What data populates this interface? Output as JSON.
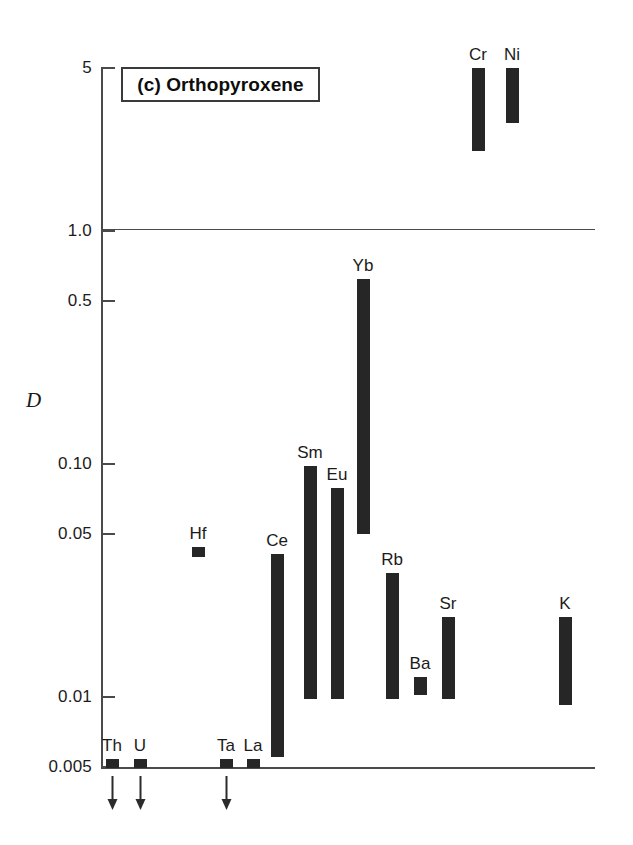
{
  "figure": {
    "panel_label": "(c) Orthopyroxene",
    "y_axis_title": "D"
  },
  "chart_data": {
    "type": "bar",
    "title": "(c) Orthopyroxene",
    "xlabel": "",
    "ylabel": "D",
    "yscale": "log",
    "ylim": [
      0.005,
      5
    ],
    "grid": "single horizontal line at D = 1.0",
    "legend": "none",
    "ytick_labels": [
      "5",
      "1.0",
      "0.5",
      "0.10",
      "0.05",
      "0.01",
      "0.005"
    ],
    "ytick_values": [
      5,
      1.0,
      0.5,
      0.1,
      0.05,
      0.01,
      0.005
    ],
    "categories": [
      "Th",
      "U",
      "Ta",
      "La",
      "Hf",
      "Ce",
      "Sm",
      "Eu",
      "Yb",
      "Rb",
      "Ba",
      "Sr",
      "K",
      "Cr",
      "Ni"
    ],
    "ranges": [
      {
        "name": "Th",
        "low": 0.005,
        "high": 0.0054,
        "upper_limit": true,
        "x": 112
      },
      {
        "name": "U",
        "low": 0.005,
        "high": 0.0054,
        "upper_limit": true,
        "x": 140
      },
      {
        "name": "Ta",
        "low": 0.005,
        "high": 0.0054,
        "upper_limit": true,
        "x": 226
      },
      {
        "name": "La",
        "low": 0.005,
        "high": 0.0054,
        "upper_limit": false,
        "x": 253
      },
      {
        "name": "Hf",
        "low": 0.04,
        "high": 0.044,
        "upper_limit": false,
        "x": 198
      },
      {
        "name": "Ce",
        "low": 0.0055,
        "high": 0.041,
        "upper_limit": false,
        "x": 277
      },
      {
        "name": "Sm",
        "low": 0.0098,
        "high": 0.098,
        "upper_limit": false,
        "x": 310
      },
      {
        "name": "Eu",
        "low": 0.0098,
        "high": 0.079,
        "upper_limit": false,
        "x": 337
      },
      {
        "name": "Yb",
        "low": 0.05,
        "high": 0.62,
        "upper_limit": false,
        "x": 363
      },
      {
        "name": "Rb",
        "low": 0.0098,
        "high": 0.034,
        "upper_limit": false,
        "x": 392
      },
      {
        "name": "Ba",
        "low": 0.0102,
        "high": 0.0122,
        "upper_limit": false,
        "x": 420
      },
      {
        "name": "Sr",
        "low": 0.0098,
        "high": 0.022,
        "upper_limit": false,
        "x": 448
      },
      {
        "name": "K",
        "low": 0.0092,
        "high": 0.022,
        "upper_limit": false,
        "x": 565
      },
      {
        "name": "Cr",
        "low": 2.2,
        "high": 5.0,
        "upper_limit": false,
        "x": 478
      },
      {
        "name": "Ni",
        "low": 2.9,
        "high": 5.0,
        "upper_limit": false,
        "x": 512
      }
    ]
  }
}
